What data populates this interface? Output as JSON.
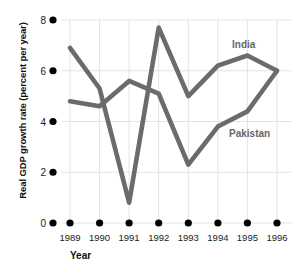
{
  "chart_data": {
    "type": "line",
    "title": "",
    "xlabel": "Year",
    "ylabel": "Real GDP growth rate (percent per year)",
    "categories": [
      "1989",
      "1990",
      "1991",
      "1992",
      "1993",
      "1994",
      "1995",
      "1996"
    ],
    "x": [
      1989,
      1990,
      1991,
      1992,
      1993,
      1994,
      1995,
      1996
    ],
    "xlim": [
      1988.3,
      1996.6
    ],
    "ylim": [
      0,
      8
    ],
    "yticks": [
      0,
      2,
      4,
      6,
      8
    ],
    "ytick_labels": [
      "0",
      "2",
      "4",
      "6",
      "8"
    ],
    "grid": true,
    "legend_position": "inline-labels",
    "series": [
      {
        "name": "India",
        "color": "#6b6b6b",
        "values": [
          6.9,
          5.3,
          0.8,
          7.7,
          5.0,
          6.2,
          6.6,
          6.0
        ],
        "label_position": {
          "year": 1995,
          "value": 7.1
        }
      },
      {
        "name": "Pakistan",
        "color": "#6b6b6b",
        "values": [
          4.8,
          4.6,
          5.6,
          5.1,
          2.3,
          3.8,
          4.4,
          6.0
        ],
        "label_position": {
          "year": 1995,
          "value": 3.6
        }
      }
    ],
    "annotations": [
      {
        "text": "India",
        "kind": "series-label"
      },
      {
        "text": "Pakistan",
        "kind": "series-label"
      }
    ]
  },
  "axes": {
    "y_title": "Real GDP growth rate (percent per year)",
    "x_title": "Year",
    "y_tick_labels": [
      "8",
      "6",
      "4",
      "2",
      "0"
    ],
    "x_tick_labels": [
      "1989",
      "1990",
      "1991",
      "1992",
      "1993",
      "1994",
      "1995",
      "1996"
    ]
  },
  "colors": {
    "line": "#6b6b6b",
    "grid": "#e3e3e3",
    "marker": "#000000",
    "text": "#1a1a1a",
    "label": "#666666",
    "background": "#ffffff"
  }
}
